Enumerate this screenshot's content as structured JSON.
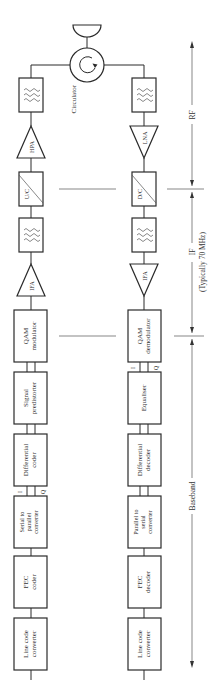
{
  "diagram": {
    "circulator_label": "Circulator",
    "transmit_chain": {
      "filter_rf": "filter",
      "hpa": "HPA",
      "upconverter": "U/C",
      "filter_if": "filter",
      "ifa": "IFA",
      "qam_modulator": [
        "QAM",
        "modulator"
      ],
      "signal_predistorter": [
        "Signal",
        "predistorter"
      ],
      "differential_coder": [
        "Differential",
        "coder"
      ],
      "serial_to_parallel": [
        "Serial to",
        "parallel",
        "converter"
      ],
      "fec_coder": [
        "FEC",
        "coder"
      ],
      "line_code_converter": [
        "Line code",
        "converter"
      ],
      "i_label": "I",
      "q_label": "Q"
    },
    "receive_chain": {
      "filter_rf": "filter",
      "lna": "LNA",
      "downconverter": "D/C",
      "filter_if": "filter",
      "ifa": "IFA",
      "qam_demodulator": [
        "QAM",
        "demodulator"
      ],
      "equaliser": [
        "Equaliser"
      ],
      "differential_decoder": [
        "Differential",
        "decoder"
      ],
      "parallel_to_serial": [
        "Parallel to",
        "serial",
        "converter"
      ],
      "fec_decoder": [
        "FEC",
        "decoder"
      ],
      "line_code_converter": [
        "Line code",
        "converter"
      ],
      "i_label": "I",
      "q_label": "Q"
    },
    "annotations": {
      "rf": "RF",
      "if": "IF",
      "if_note": "(Typically 70 MHz)",
      "baseband": "Baseband"
    }
  }
}
